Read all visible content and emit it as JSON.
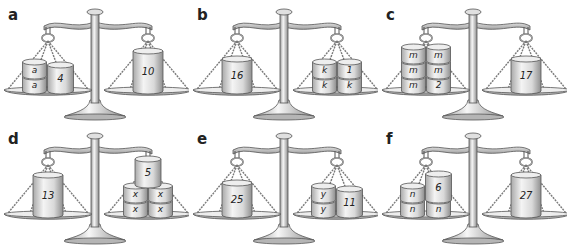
{
  "colors": {
    "metal_light": "#f2f2f2",
    "metal_mid": "#c8c8c8",
    "metal_dark": "#8a8a8a",
    "outline": "#555555",
    "label": "#222222",
    "weight_text": "#222222"
  },
  "panels": [
    {
      "label": "a",
      "left": [
        {
          "text": "a",
          "col": 0,
          "row": 0,
          "size": "small"
        },
        {
          "text": "a",
          "col": 0,
          "row": 1,
          "size": "small"
        },
        {
          "text": "4",
          "col": 1,
          "row": 0,
          "size": "medium"
        }
      ],
      "right": [
        {
          "text": "10",
          "col": 0,
          "row": 0,
          "size": "tall"
        }
      ]
    },
    {
      "label": "b",
      "left": [
        {
          "text": "16",
          "col": 0,
          "row": 0,
          "size": "medium-tall"
        }
      ],
      "right": [
        {
          "text": "k",
          "col": 0,
          "row": 0,
          "size": "small"
        },
        {
          "text": "k",
          "col": 0,
          "row": 1,
          "size": "small"
        },
        {
          "text": "k",
          "col": 1,
          "row": 0,
          "size": "small"
        },
        {
          "text": "1",
          "col": 1,
          "row": 1,
          "size": "small"
        }
      ]
    },
    {
      "label": "c",
      "left": [
        {
          "text": "m",
          "col": 0,
          "row": 0,
          "size": "small"
        },
        {
          "text": "m",
          "col": 0,
          "row": 1,
          "size": "small"
        },
        {
          "text": "m",
          "col": 0,
          "row": 2,
          "size": "small"
        },
        {
          "text": "2",
          "col": 1,
          "row": 0,
          "size": "small"
        },
        {
          "text": "m",
          "col": 1,
          "row": 1,
          "size": "small"
        },
        {
          "text": "m",
          "col": 1,
          "row": 2,
          "size": "small"
        }
      ],
      "right": [
        {
          "text": "17",
          "col": 0,
          "row": 0,
          "size": "medium-tall"
        }
      ]
    },
    {
      "label": "d",
      "left": [
        {
          "text": "13",
          "col": 0,
          "row": 0,
          "size": "tall"
        }
      ],
      "right": [
        {
          "text": "x",
          "col": 0,
          "row": 0,
          "size": "small"
        },
        {
          "text": "x",
          "col": 0,
          "row": 1,
          "size": "small"
        },
        {
          "text": "x",
          "col": 1,
          "row": 0,
          "size": "small"
        },
        {
          "text": "x",
          "col": 1,
          "row": 1,
          "size": "small"
        },
        {
          "text": "5",
          "col": 0.5,
          "row": 2,
          "size": "medium"
        }
      ]
    },
    {
      "label": "e",
      "left": [
        {
          "text": "25",
          "col": 0,
          "row": 0,
          "size": "medium-tall"
        }
      ],
      "right": [
        {
          "text": "y",
          "col": 0,
          "row": 0,
          "size": "small"
        },
        {
          "text": "y",
          "col": 0,
          "row": 1,
          "size": "small"
        },
        {
          "text": "11",
          "col": 1,
          "row": 0,
          "size": "medium"
        }
      ]
    },
    {
      "label": "f",
      "left": [
        {
          "text": "n",
          "col": 0,
          "row": 0,
          "size": "small"
        },
        {
          "text": "n",
          "col": 0,
          "row": 1,
          "size": "small"
        },
        {
          "text": "n",
          "col": 1,
          "row": 0,
          "size": "small"
        },
        {
          "text": "6",
          "col": 1,
          "row": 1,
          "size": "medium"
        }
      ],
      "right": [
        {
          "text": "27",
          "col": 0,
          "row": 0,
          "size": "tall"
        }
      ]
    }
  ]
}
